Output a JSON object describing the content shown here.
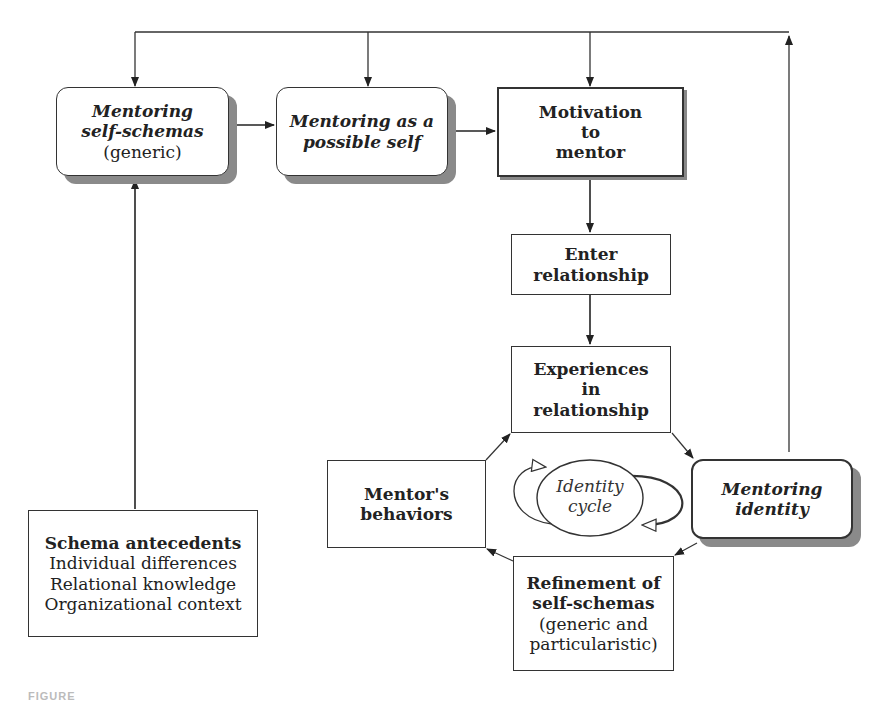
{
  "diagram": {
    "nodes": {
      "self_schemas": {
        "line1": "Mentoring",
        "line2": "self-schemas",
        "line3": "(generic)"
      },
      "possible_self": {
        "line1": "Mentoring as a",
        "line2": "possible self"
      },
      "motivation": {
        "line1": "Motivation",
        "line2": "to",
        "line3": "mentor"
      },
      "enter": {
        "line1": "Enter",
        "line2": "relationship"
      },
      "experiences": {
        "line1": "Experiences",
        "line2": "in",
        "line3": "relationship"
      },
      "behaviors": {
        "line1": "Mentor's",
        "line2": "behaviors"
      },
      "identity": {
        "line1": "Mentoring",
        "line2": "identity"
      },
      "refinement": {
        "line1": "Refinement of",
        "line2": "self-schemas",
        "line3": "(generic and",
        "line4": "particularistic)"
      },
      "antecedents": {
        "title": "Schema antecedents",
        "item1": "Individual differences",
        "item2": "Relational knowledge",
        "item3": "Organizational context"
      },
      "cycle": {
        "line1": "Identity",
        "line2": "cycle"
      }
    },
    "edges": [
      {
        "from": "self_schemas",
        "to": "possible_self"
      },
      {
        "from": "possible_self",
        "to": "motivation"
      },
      {
        "from": "motivation",
        "to": "enter"
      },
      {
        "from": "enter",
        "to": "experiences"
      },
      {
        "from": "experiences",
        "to": "identity"
      },
      {
        "from": "identity",
        "to": "refinement"
      },
      {
        "from": "refinement",
        "to": "behaviors"
      },
      {
        "from": "behaviors",
        "to": "experiences"
      },
      {
        "from": "antecedents",
        "to": "self_schemas"
      },
      {
        "from": "identity",
        "to": "self_schemas"
      },
      {
        "from": "identity",
        "to": "possible_self"
      },
      {
        "from": "identity",
        "to": "motivation"
      }
    ],
    "caption": "FIGURE"
  }
}
